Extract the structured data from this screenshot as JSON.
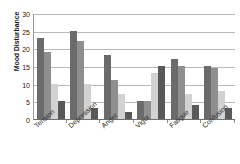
{
  "chart_data": {
    "type": "bar",
    "title": "",
    "xlabel": "",
    "ylabel": "Mood Disturbance",
    "ylim": [
      0,
      30
    ],
    "yticks": [
      0,
      5,
      10,
      15,
      20,
      25,
      30
    ],
    "ytick_labels": [
      "0",
      "5",
      "10",
      "15",
      "20",
      "25",
      "30"
    ],
    "grid": true,
    "legend": "none",
    "categories": [
      "Tension",
      "Depression",
      "Anger",
      "Vigor",
      "Fatigue",
      "Confusion"
    ],
    "series": [
      {
        "name": "series-1",
        "color": "#6b6b6b",
        "values": [
          23,
          25,
          18,
          5,
          17,
          15
        ]
      },
      {
        "name": "series-2",
        "color": "#8f8f8f",
        "values": [
          19,
          22,
          11,
          5,
          15,
          14.5
        ]
      },
      {
        "name": "series-3",
        "color": "#d2d2d2",
        "values": [
          10,
          10,
          7,
          13,
          7,
          8
        ]
      },
      {
        "name": "series-4",
        "color": "#595959",
        "values": [
          5,
          3,
          2,
          15,
          4,
          3
        ]
      }
    ]
  },
  "axis": {
    "y_title": "Mood Disturbance"
  }
}
